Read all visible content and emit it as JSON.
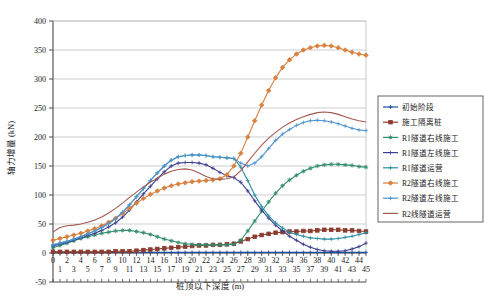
{
  "chart_data": {
    "type": "line",
    "title": "",
    "xlabel": "桩顶以下深度 (m)",
    "ylabel": "轴力增量 (kN)",
    "xlim": [
      0,
      45
    ],
    "ylim": [
      -50,
      400
    ],
    "yticks": [
      -50,
      0,
      50,
      100,
      150,
      200,
      250,
      300,
      350,
      400
    ],
    "xticks": [
      0,
      1,
      2,
      3,
      4,
      5,
      6,
      7,
      8,
      9,
      10,
      11,
      12,
      13,
      14,
      15,
      16,
      17,
      18,
      19,
      20,
      21,
      22,
      23,
      24,
      25,
      26,
      27,
      28,
      29,
      30,
      31,
      32,
      33,
      34,
      35,
      36,
      37,
      38,
      39,
      40,
      41,
      42,
      43,
      44,
      45
    ],
    "grid": "horizontal",
    "legend_position": "right",
    "x": [
      0,
      1,
      2,
      3,
      4,
      5,
      6,
      7,
      8,
      9,
      10,
      11,
      12,
      13,
      14,
      15,
      16,
      17,
      18,
      19,
      20,
      21,
      22,
      23,
      24,
      25,
      26,
      27,
      28,
      29,
      30,
      31,
      32,
      33,
      34,
      35,
      36,
      37,
      38,
      39,
      40,
      41,
      42,
      43,
      44,
      45
    ],
    "series": [
      {
        "name": "初始阶段",
        "color": "#1f4e9c",
        "marker": "plus",
        "values": [
          1,
          1,
          1,
          1,
          1,
          1,
          1,
          1,
          1,
          1,
          1,
          1,
          1,
          1,
          1,
          1,
          1,
          1,
          1,
          1,
          1,
          1,
          1,
          1,
          1,
          1,
          1,
          1,
          1,
          1,
          1,
          1,
          1,
          1,
          1,
          1,
          1,
          1,
          1,
          1,
          1,
          1,
          1,
          1,
          1,
          1
        ]
      },
      {
        "name": "施工隔离桩",
        "color": "#8c3b2e",
        "marker": "square",
        "values": [
          2,
          2,
          2,
          2,
          2,
          2,
          2,
          2,
          2,
          3,
          3,
          3,
          4,
          5,
          6,
          7,
          8,
          9,
          10,
          11,
          12,
          13,
          13,
          14,
          14,
          15,
          16,
          20,
          24,
          28,
          31,
          33,
          35,
          36,
          37,
          37,
          38,
          38,
          39,
          40,
          40,
          40,
          39,
          39,
          38,
          37
        ]
      },
      {
        "name": "R1隧道右线施工",
        "color": "#2e8b6f",
        "marker": "star",
        "values": [
          9,
          13,
          17,
          21,
          25,
          28,
          31,
          34,
          36,
          38,
          39,
          39,
          37,
          35,
          32,
          28,
          24,
          21,
          18,
          16,
          15,
          14,
          14,
          14,
          14,
          14,
          15,
          22,
          38,
          55,
          72,
          88,
          103,
          116,
          126,
          134,
          141,
          146,
          150,
          152,
          153,
          153,
          152,
          151,
          149,
          148
        ]
      },
      {
        "name": "R1隧道左线施工",
        "color": "#3b3f8f",
        "marker": "plus",
        "values": [
          12,
          15,
          18,
          22,
          26,
          30,
          34,
          39,
          45,
          52,
          62,
          74,
          88,
          102,
          115,
          128,
          140,
          150,
          155,
          156,
          156,
          155,
          152,
          146,
          139,
          133,
          130,
          122,
          107,
          90,
          74,
          60,
          48,
          38,
          29,
          22,
          15,
          10,
          6,
          4,
          3,
          3,
          4,
          7,
          11,
          17
        ]
      },
      {
        "name": "R1隧道运营",
        "color": "#2c8fa3",
        "marker": "plus",
        "values": [
          14,
          17,
          20,
          24,
          28,
          33,
          38,
          44,
          51,
          59,
          70,
          83,
          97,
          111,
          125,
          138,
          150,
          160,
          166,
          168,
          169,
          169,
          168,
          166,
          165,
          164,
          163,
          148,
          125,
          100,
          80,
          64,
          52,
          43,
          36,
          32,
          29,
          26,
          25,
          24,
          24,
          25,
          27,
          29,
          32,
          35
        ]
      },
      {
        "name": "R2隧道右线施工",
        "color": "#d9813f",
        "marker": "diamond",
        "values": [
          22,
          25,
          28,
          31,
          34,
          38,
          42,
          47,
          53,
          60,
          68,
          77,
          86,
          94,
          101,
          107,
          112,
          116,
          119,
          121,
          123,
          124,
          125,
          126,
          128,
          135,
          150,
          172,
          200,
          228,
          255,
          280,
          302,
          320,
          333,
          343,
          350,
          354,
          357,
          358,
          357,
          354,
          350,
          346,
          343,
          341
        ]
      },
      {
        "name": "R2隧道左线施工",
        "color": "#4f94cd",
        "marker": "plus",
        "values": [
          14,
          17,
          20,
          24,
          28,
          33,
          38,
          44,
          51,
          59,
          70,
          83,
          97,
          111,
          125,
          138,
          150,
          160,
          166,
          168,
          169,
          169,
          168,
          166,
          165,
          164,
          163,
          155,
          150,
          155,
          166,
          180,
          194,
          205,
          213,
          220,
          225,
          228,
          229,
          228,
          226,
          223,
          219,
          215,
          212,
          211
        ]
      },
      {
        "name": "R2线隧道运营",
        "color": "#a35950",
        "marker": "none",
        "values": [
          36,
          44,
          47,
          48,
          50,
          53,
          57,
          62,
          69,
          77,
          86,
          96,
          105,
          114,
          122,
          129,
          136,
          141,
          144,
          145,
          143,
          138,
          132,
          128,
          127,
          128,
          131,
          142,
          157,
          172,
          186,
          198,
          208,
          217,
          224,
          230,
          235,
          239,
          242,
          243,
          242,
          239,
          235,
          231,
          228,
          226
        ]
      }
    ]
  }
}
